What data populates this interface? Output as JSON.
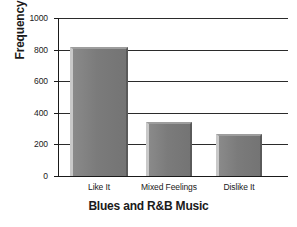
{
  "chart_data": {
    "type": "bar",
    "title": "",
    "xlabel": "Blues and R&B Music",
    "ylabel": "Frequency",
    "categories": [
      "Like It",
      "Mixed Feelings",
      "Dislike It"
    ],
    "values": [
      815,
      342,
      266
    ],
    "ylim": [
      0,
      1000
    ],
    "yticks": [
      0,
      200,
      400,
      600,
      800,
      1000
    ],
    "ytick_labels": [
      "0",
      "200",
      "400",
      "600",
      "800",
      "1000"
    ],
    "grid": true,
    "grid_axis": "y",
    "legend": false,
    "bar_color": "#7e7e7e",
    "bar_highlight_color": "#c9c9c9",
    "bar_shadow_color": "#5a5a5a",
    "axis_color": "#1a1a1a",
    "background_color": "#ffffff"
  }
}
